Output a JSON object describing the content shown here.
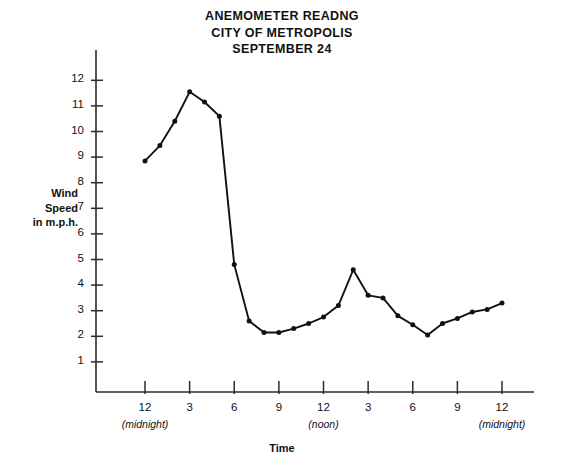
{
  "chart_data": {
    "type": "line",
    "title": "ANEMOMETER READNG",
    "subtitle": "CITY OF METROPOLIS",
    "subtitle2": "SEPTEMBER 24",
    "title_lines": [
      "ANEMOMETER READNG",
      "CITY OF METROPOLIS",
      "SEPTEMBER 24"
    ],
    "xlabel": "Time",
    "ylabel": "Wind Speed in m.p.h.",
    "ylabel_lines": [
      "Wind",
      "Speed",
      "in m.p.h."
    ],
    "xlim": [
      0,
      24
    ],
    "ylim": [
      0,
      12.6
    ],
    "grid": false,
    "legend": null,
    "marker": "filled-circle",
    "line_color": "#111111",
    "yticks": [
      1,
      2,
      3,
      4,
      5,
      6,
      7,
      8,
      9,
      10,
      11,
      12
    ],
    "ytick_labels": [
      "1",
      "2",
      "3",
      "4",
      "5",
      "6",
      "7",
      "8",
      "9",
      "10",
      "11",
      "12"
    ],
    "xticks": [
      0,
      3,
      6,
      9,
      12,
      15,
      18,
      21,
      24
    ],
    "xtick_labels": [
      "12",
      "3",
      "6",
      "9",
      "12",
      "3",
      "6",
      "9",
      "12"
    ],
    "xtick_sublabels": [
      "(midnight)",
      "",
      "",
      "",
      "(noon)",
      "",
      "",
      "",
      "(midnight)"
    ],
    "x": [
      0,
      1,
      2,
      3,
      4,
      5,
      6,
      7,
      8,
      9,
      10,
      11,
      12,
      13,
      14,
      15,
      16,
      17,
      18,
      19,
      20,
      21,
      22,
      23,
      24
    ],
    "values": [
      8.85,
      9.45,
      10.4,
      11.55,
      11.15,
      10.6,
      4.8,
      2.6,
      2.15,
      2.15,
      2.3,
      2.5,
      2.75,
      3.2,
      4.6,
      3.6,
      3.5,
      2.8,
      2.45,
      2.05,
      2.5,
      2.7,
      2.95,
      3.05,
      3.3
    ],
    "series": [
      {
        "name": "Wind Speed",
        "values": [
          8.85,
          9.45,
          10.4,
          11.55,
          11.15,
          10.6,
          4.8,
          2.6,
          2.15,
          2.15,
          2.3,
          2.5,
          2.75,
          3.2,
          4.6,
          3.6,
          3.5,
          2.8,
          2.45,
          2.05,
          2.5,
          2.7,
          2.95,
          3.05,
          3.3
        ]
      }
    ]
  }
}
